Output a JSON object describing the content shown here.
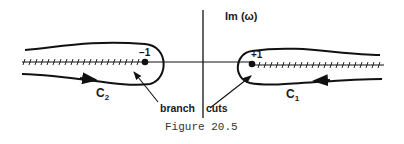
{
  "figure": {
    "caption": "Figure 20.5",
    "axis_label": "Im (ω)",
    "points": [
      {
        "label": "−1"
      },
      {
        "label": "+1"
      }
    ],
    "contours": [
      {
        "label": "C",
        "sub": "2"
      },
      {
        "label": "C",
        "sub": "1"
      }
    ],
    "annotation_left": "branch",
    "annotation_right": "cuts"
  }
}
